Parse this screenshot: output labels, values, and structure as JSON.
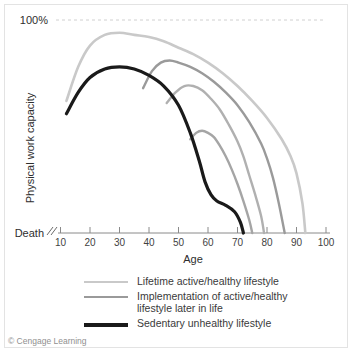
{
  "chart_data": {
    "type": "line",
    "title": "",
    "xlabel": "Age",
    "ylabel": "Physical work capacity",
    "xlim": [
      5,
      100
    ],
    "ylim": [
      0,
      110
    ],
    "xticks": [
      10,
      20,
      30,
      40,
      50,
      60,
      70,
      80,
      90,
      100
    ],
    "yticks": [],
    "y_top_label": "100%",
    "y_bottom_label": "Death",
    "grid": false,
    "axis_break": true,
    "reference_line": {
      "value": 100,
      "label": "100%",
      "style": "dashed"
    },
    "legend_position": "below",
    "series": [
      {
        "name": "Lifetime active/healthy lifestyle",
        "color": "#c9c9c9",
        "width": 2.6,
        "x": [
          12,
          16,
          20,
          25,
          30,
          35,
          40,
          45,
          50,
          55,
          60,
          65,
          70,
          75,
          80,
          85,
          88,
          90,
          92,
          93
        ],
        "values": [
          62,
          78,
          88,
          93,
          94,
          93,
          92,
          90,
          87,
          84,
          80,
          75,
          69,
          62,
          54,
          44,
          36,
          28,
          14,
          0
        ]
      },
      {
        "name": "Implementation of active/healthy lifestyle later in life (mid-life)",
        "color": "#9a9a9a",
        "width": 2.4,
        "x": [
          38,
          41,
          44,
          47,
          50,
          54,
          58,
          62,
          66,
          70,
          74,
          78,
          80,
          82,
          84,
          86
        ],
        "values": [
          68,
          76,
          80,
          81,
          80,
          78,
          75,
          71,
          66,
          60,
          52,
          42,
          35,
          26,
          14,
          0
        ]
      },
      {
        "name": "Implementation of active/healthy lifestyle later in life (late-life)",
        "color": "#b0b0b0",
        "width": 2.4,
        "x": [
          46,
          49,
          52,
          55,
          58,
          61,
          64,
          67,
          70,
          72,
          74,
          76,
          78,
          79
        ],
        "values": [
          61,
          66,
          69,
          69,
          67,
          63,
          58,
          51,
          43,
          36,
          27,
          18,
          8,
          0
        ]
      },
      {
        "name": "Implementation of active/healthy lifestyle later in life (short branch)",
        "color": "#a5a5a5",
        "width": 2.4,
        "x": [
          54,
          56,
          58,
          60,
          62,
          64,
          66,
          68,
          70,
          72,
          74,
          75
        ],
        "values": [
          44,
          47,
          48,
          47,
          45,
          41,
          36,
          30,
          23,
          15,
          6,
          0
        ]
      },
      {
        "name": "Sedentary unhealthy lifestyle",
        "color": "#1a1a1a",
        "width": 3.2,
        "x": [
          12,
          16,
          20,
          25,
          30,
          35,
          40,
          45,
          50,
          54,
          57,
          59,
          61,
          63,
          66,
          69,
          71,
          72
        ],
        "values": [
          56,
          66,
          73,
          77,
          78,
          77,
          74,
          69,
          60,
          47,
          34,
          24,
          18,
          15,
          13,
          10,
          5,
          0
        ]
      }
    ]
  },
  "axes": {
    "x_title": "Age",
    "y_title": "Physical work capacity",
    "top_label": "100%",
    "bottom_label": "Death",
    "x_tick_labels": [
      "10",
      "20",
      "30",
      "40",
      "50",
      "60",
      "70",
      "80",
      "90",
      "100"
    ]
  },
  "legend": {
    "items": [
      {
        "label": "Lifetime active/healthy lifestyle",
        "color": "#c9c9c9",
        "thickness": "2px"
      },
      {
        "label": "Implementation of active/healthy\nlifestyle later in life",
        "color": "#9a9a9a",
        "thickness": "2px"
      },
      {
        "label": "Sedentary unhealthy lifestyle",
        "color": "#1a1a1a",
        "thickness": "4px"
      }
    ]
  },
  "credit": "© Cengage Learning"
}
